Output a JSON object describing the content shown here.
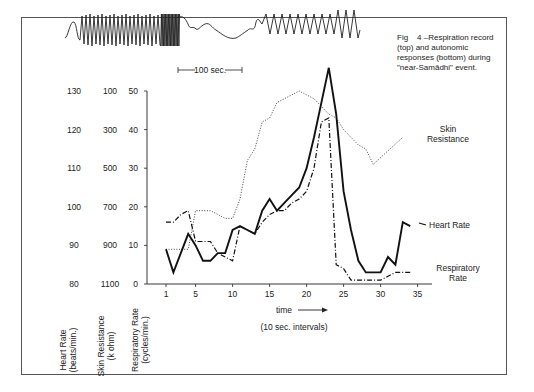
{
  "caption": {
    "fig": "Fig",
    "number": "4",
    "text": "–Respiration record (top) and autonomic responses (bottom) during \"near-Samādhi\" event."
  },
  "respiration_record": {
    "scale_label": "100 sec."
  },
  "chart_data": {
    "type": "line",
    "xlabel": "time",
    "xlabel_note": "(10 sec. intervals)",
    "x_ticks": [
      1,
      5,
      10,
      15,
      20,
      25,
      30,
      35
    ],
    "x": [
      1,
      2,
      3,
      4,
      5,
      6,
      7,
      8,
      9,
      10,
      11,
      12,
      13,
      14,
      15,
      16,
      17,
      18,
      19,
      20,
      21,
      22,
      23,
      24,
      25,
      26,
      27,
      28,
      29,
      30,
      31,
      32,
      33,
      34
    ],
    "y_axes": [
      {
        "label": "Heart Rate",
        "unit": "(beats/min.)",
        "ticks": [
          "130",
          "120",
          "110",
          "100",
          "90",
          "80"
        ]
      },
      {
        "label": "Skin Resistance",
        "unit": "(k ohm)",
        "ticks": [
          "100",
          "300",
          "500",
          "700",
          "900",
          "1100"
        ]
      },
      {
        "label": "Respiratory Rate",
        "unit": "(cycles/min.)",
        "ticks": [
          "50",
          "40",
          "30",
          "20",
          "10",
          "0"
        ]
      }
    ],
    "ylim": [
      0,
      50
    ],
    "grid": false,
    "series": [
      {
        "name": "Heart Rate",
        "style": "solid",
        "values": [
          9,
          3,
          8,
          13,
          10,
          6,
          6,
          8,
          8,
          14,
          15,
          14,
          13,
          19,
          22,
          19,
          21,
          23,
          25,
          30,
          38,
          47,
          56,
          44,
          24,
          14,
          6,
          3,
          3,
          3,
          7,
          5,
          16,
          15
        ]
      },
      {
        "name": "Respiratory Rate",
        "style": "dash-dot",
        "values": [
          16,
          16,
          18,
          19,
          11,
          11,
          11,
          8,
          7,
          6,
          15,
          14,
          13,
          16,
          18,
          19,
          19,
          21,
          22,
          24,
          30,
          42,
          43,
          5,
          4,
          1,
          1,
          1,
          1,
          1,
          2,
          3,
          3,
          3
        ]
      },
      {
        "name": "Skin Resistance",
        "style": "dotted",
        "values": [
          9,
          9,
          9,
          9,
          19,
          19,
          19,
          18,
          17,
          17,
          22,
          32,
          35,
          42,
          43,
          47,
          48,
          49,
          50,
          49,
          48,
          46,
          44,
          43,
          40,
          38,
          36,
          35,
          31,
          null,
          null,
          null,
          null,
          null
        ]
      }
    ],
    "legend": {
      "skin_resistance": [
        "Skin",
        "Resistance"
      ],
      "heart_rate": [
        "Heart Rate"
      ],
      "respiratory_rate": [
        "Respiratory",
        "Rate"
      ]
    }
  },
  "axis_titles": {
    "hr": [
      "Heart Rate",
      "(beats/min.)"
    ],
    "sr": [
      "Skin Resistance",
      "(k ohm)"
    ],
    "rr": [
      "Respiratory Rate",
      "(cycles/min.)"
    ]
  },
  "time_label": "time",
  "interval_label": "(10 sec. intervals)"
}
